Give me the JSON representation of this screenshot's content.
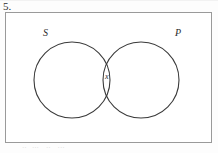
{
  "problem": {
    "number_label": "5."
  },
  "diagram": {
    "type": "venn-two-set",
    "universe_box": {
      "present": true,
      "stroke_color": "#9a9a9a",
      "fill_color": "#ffffff"
    },
    "circles": [
      {
        "id": "set-s",
        "label": "S",
        "cx": 67,
        "cy": 68,
        "r": 38,
        "stroke_color": "#3a3a3a"
      },
      {
        "id": "set-p",
        "label": "P",
        "cx": 136,
        "cy": 68,
        "r": 38,
        "stroke_color": "#3a3a3a"
      }
    ],
    "labels": [
      {
        "id": "label-s",
        "text": "S",
        "x": 38,
        "y": 24
      },
      {
        "id": "label-p",
        "text": "P",
        "x": 170,
        "y": 24
      },
      {
        "id": "label-x",
        "text": "x",
        "x": 100,
        "y": 67
      }
    ],
    "intersection_label": "x"
  },
  "footer": {
    "artifact_text": "··   ···    ··    ···"
  }
}
